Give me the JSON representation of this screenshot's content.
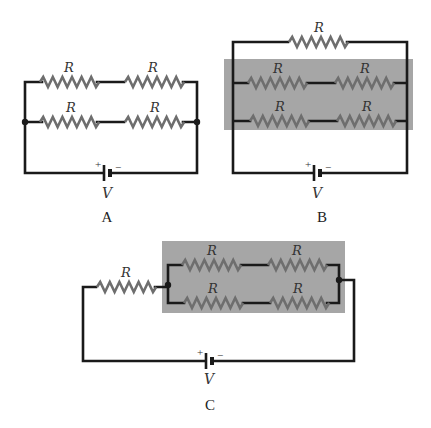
{
  "figure": {
    "colors": {
      "wire": "#1a1a1a",
      "resistor": "#6e6e6e",
      "highlight_box": "#a6a6a6",
      "background": "#ffffff"
    },
    "resistor_label": "R",
    "battery_label": "V",
    "battery_plus": "+",
    "battery_minus": "−",
    "circuits": [
      {
        "id": "A",
        "caption": "A",
        "topology": "two parallel branches, each with two R in series",
        "resistor_count": 4,
        "highlighted": false
      },
      {
        "id": "B",
        "caption": "B",
        "topology": "one R in parallel with a highlighted block of two branches (each two R in series)",
        "resistor_count": 5,
        "highlighted": true
      },
      {
        "id": "C",
        "caption": "C",
        "topology": "one R in series with a highlighted block of two parallel branches (each two R in series)",
        "resistor_count": 5,
        "highlighted": true
      }
    ]
  }
}
